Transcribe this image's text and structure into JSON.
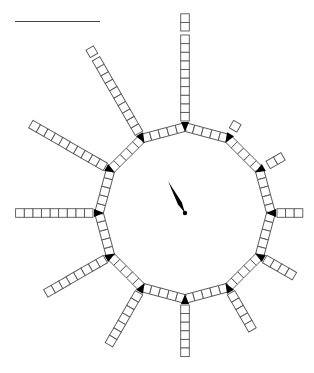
{
  "diagram": {
    "type": "clock-spoke-diagram",
    "center": {
      "x": 185,
      "y": 213
    },
    "ring": {
      "sides": 12,
      "vertex_radius": 86,
      "squares_per_edge": 5,
      "marker_color": "#000000"
    },
    "square_size": 8.6,
    "square_stroke": "#555555",
    "spokes": [
      {
        "hour": 12,
        "count": 12,
        "gap_after": 10
      },
      {
        "hour": 1,
        "count": 1,
        "gap_after": 0
      },
      {
        "hour": 2,
        "count": 2,
        "gap_after": 0
      },
      {
        "hour": 3,
        "count": 3,
        "gap_after": null
      },
      {
        "hour": 4,
        "count": 4,
        "gap_after": null
      },
      {
        "hour": 5,
        "count": 5,
        "gap_after": null
      },
      {
        "hour": 6,
        "count": 6,
        "gap_after": null
      },
      {
        "hour": 7,
        "count": 7,
        "gap_after": null
      },
      {
        "hour": 8,
        "count": 8,
        "gap_after": null
      },
      {
        "hour": 9,
        "count": 9,
        "gap_after": null
      },
      {
        "hour": 10,
        "count": 10,
        "gap_after": null
      },
      {
        "hour": 11,
        "count": 11,
        "gap_after": 10
      }
    ],
    "hand": {
      "angle_deg": -28,
      "length": 36,
      "color": "#000000"
    },
    "top_rule": {
      "x1": 15,
      "x2": 100,
      "y": 21
    }
  }
}
